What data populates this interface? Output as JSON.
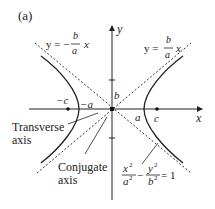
{
  "figure": {
    "panel_label": "(a)",
    "axes": {
      "x_label": "x",
      "y_label": "y"
    },
    "asymptotes": {
      "negative": {
        "lhs": "y = −",
        "num": "b",
        "den": "a",
        "rhs": "x"
      },
      "positive": {
        "lhs": "y =",
        "num": "b",
        "den": "a",
        "rhs": "x"
      }
    },
    "points": {
      "neg_c": "−c",
      "neg_a": "−a",
      "b": "b",
      "a": "a",
      "c": "c"
    },
    "annotations": {
      "transverse_line1": "Transverse",
      "transverse_line2": "axis",
      "conjugate_line1": "Conjugate",
      "conjugate_line2": "axis"
    },
    "equation": {
      "x_num": "x",
      "x_num_exp": "2",
      "x_den": "a",
      "x_den_exp": "2",
      "minus": "−",
      "y_num": "y",
      "y_num_exp": "2",
      "y_den": "b",
      "y_den_exp": "2",
      "equals": "= 1"
    },
    "colors": {
      "ink": "#222222",
      "background": "#ffffff"
    }
  }
}
